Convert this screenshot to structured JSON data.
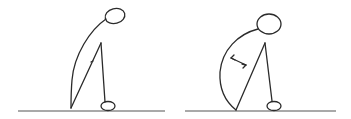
{
  "diagram": {
    "type": "posture-illustration",
    "stroke_color": "#2b2b2b",
    "background": "#ffffff",
    "figures": [
      {
        "id": "left-figure",
        "description": "Figure bent forward with rounded back, head lowered forward",
        "head": {
          "cx": 115,
          "cy": 16,
          "rx": 10,
          "ry": 7.5,
          "rotate": -15
        },
        "ground": {
          "x1": 18,
          "x2": 165,
          "y": 111
        },
        "foot": {
          "cx": 108,
          "cy": 106,
          "rx": 7,
          "ry": 4.5
        },
        "mark": "small-tick"
      },
      {
        "id": "right-figure",
        "description": "Figure bent forward with strongly rounded back; double-headed arrow indicates stretch/distance",
        "head": {
          "cx": 269,
          "cy": 24,
          "rx": 12,
          "ry": 10,
          "rotate": 0
        },
        "ground": {
          "x1": 185,
          "x2": 336,
          "y": 111
        },
        "foot": {
          "cx": 274,
          "cy": 106,
          "rx": 7,
          "ry": 4.5
        },
        "mark": "double-headed-arrow"
      }
    ]
  }
}
